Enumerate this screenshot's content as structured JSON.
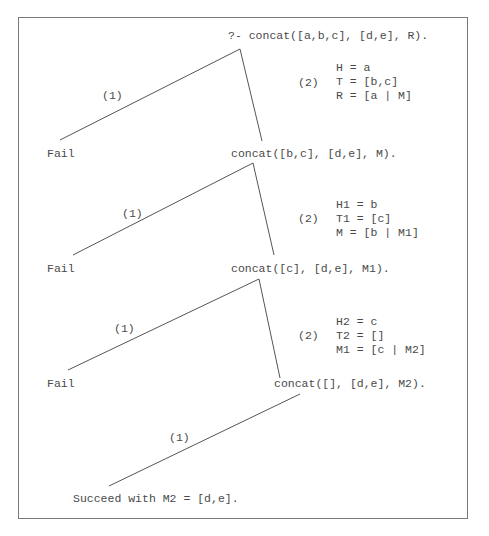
{
  "query": "?- concat([a,b,c], [d,e], R).",
  "levels": [
    {
      "fail_label": "Fail",
      "clause1_label": "(1)",
      "clause2_label": "(2)",
      "bindings": [
        "H = a",
        "T = [b,c]",
        "R = [a | M]"
      ],
      "next_goal": "concat([b,c], [d,e], M)."
    },
    {
      "fail_label": "Fail",
      "clause1_label": "(1)",
      "clause2_label": "(2)",
      "bindings": [
        "H1 = b",
        "T1 = [c]",
        "M = [b | M1]"
      ],
      "next_goal": "concat([c], [d,e], M1)."
    },
    {
      "fail_label": "Fail",
      "clause1_label": "(1)",
      "clause2_label": "(2)",
      "bindings": [
        "H2 = c",
        "T2 = []",
        "M1 = [c | M2]"
      ],
      "next_goal": "concat([], [d,e], M2)."
    }
  ],
  "final": {
    "clause1_label": "(1)",
    "result": "Succeed with M2 = [d,e]."
  },
  "colors": {
    "text": "#4a4a4a",
    "line": "#555555",
    "border": "#7a7a7a"
  }
}
